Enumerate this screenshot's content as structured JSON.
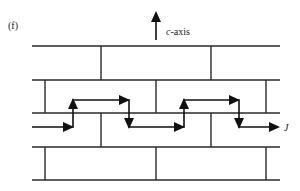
{
  "figure": {
    "panel_label": "(f)",
    "axis": {
      "symbol": "c",
      "suffix": "-axis",
      "direction": "up"
    },
    "current_label": "J",
    "layers_y": [
      46,
      80,
      113,
      147,
      180
    ],
    "layer_x_range": [
      32,
      280
    ],
    "rows": [
      {
        "top": 46,
        "bottom": 80,
        "walls_x": [
          101,
          211
        ]
      },
      {
        "top": 80,
        "bottom": 113,
        "walls_x": [
          45,
          156,
          266
        ]
      },
      {
        "top": 113,
        "bottom": 147,
        "walls_x": [
          101,
          211
        ]
      },
      {
        "top": 147,
        "bottom": 180,
        "walls_x": [
          45,
          156,
          266
        ]
      }
    ],
    "current_path": {
      "description": "Stepped current path zigzagging up and down across the c-axis layers",
      "points": [
        [
          32,
          127
        ],
        [
          73,
          127
        ],
        [
          73,
          100
        ],
        [
          129,
          100
        ],
        [
          129,
          127
        ],
        [
          184,
          127
        ],
        [
          184,
          100
        ],
        [
          239,
          100
        ],
        [
          239,
          127
        ],
        [
          278,
          127
        ]
      ]
    },
    "colors": {
      "lines": "#2a2a2a",
      "arrows": "#111111",
      "background": "#ffffff"
    }
  }
}
